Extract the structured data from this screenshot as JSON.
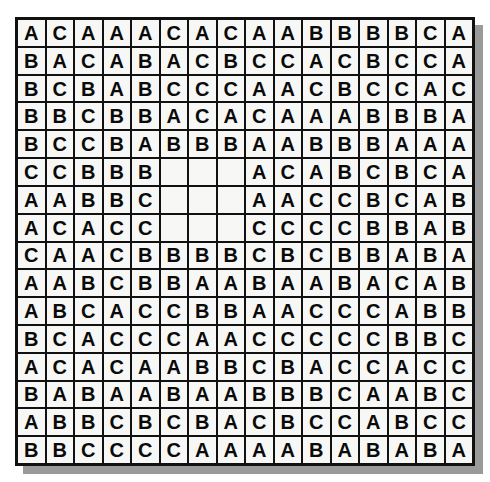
{
  "diagram": {
    "type": "character-grid",
    "rows": 16,
    "columns": 16,
    "alphabet": [
      "A",
      "B",
      "C"
    ],
    "empty_cell_symbol": "",
    "colors": {
      "background": "#ffffff",
      "cell_fill": "#f7f7f5",
      "grid_line": "#111111",
      "letter": "#0a0a0a",
      "shadow": "#9a9a9a"
    },
    "empty_region": {
      "row_start": 6,
      "row_end": 8,
      "column_start": 6,
      "column_end": 8
    },
    "grid": [
      [
        "A",
        "C",
        "A",
        "A",
        "A",
        "C",
        "A",
        "C",
        "A",
        "A",
        "B",
        "B",
        "B",
        "B",
        "C",
        "A"
      ],
      [
        "B",
        "A",
        "C",
        "A",
        "B",
        "A",
        "C",
        "B",
        "C",
        "C",
        "A",
        "C",
        "B",
        "C",
        "C",
        "A"
      ],
      [
        "B",
        "C",
        "B",
        "A",
        "B",
        "C",
        "C",
        "C",
        "A",
        "A",
        "C",
        "B",
        "C",
        "C",
        "A",
        "C"
      ],
      [
        "B",
        "B",
        "C",
        "B",
        "B",
        "A",
        "C",
        "A",
        "C",
        "A",
        "A",
        "A",
        "B",
        "B",
        "B",
        "A"
      ],
      [
        "B",
        "C",
        "C",
        "B",
        "A",
        "B",
        "B",
        "B",
        "A",
        "A",
        "B",
        "B",
        "B",
        "A",
        "A",
        "A"
      ],
      [
        "C",
        "C",
        "B",
        "B",
        "B",
        "",
        "",
        "",
        "A",
        "C",
        "A",
        "B",
        "C",
        "B",
        "C",
        "A"
      ],
      [
        "A",
        "A",
        "B",
        "B",
        "C",
        "",
        "",
        "",
        "A",
        "A",
        "C",
        "C",
        "B",
        "C",
        "A",
        "B"
      ],
      [
        "A",
        "C",
        "A",
        "C",
        "C",
        "",
        "",
        "",
        "C",
        "C",
        "C",
        "C",
        "B",
        "B",
        "A",
        "B"
      ],
      [
        "C",
        "A",
        "A",
        "C",
        "B",
        "B",
        "B",
        "B",
        "C",
        "B",
        "C",
        "B",
        "B",
        "A",
        "B",
        "A"
      ],
      [
        "A",
        "A",
        "B",
        "C",
        "B",
        "B",
        "A",
        "A",
        "B",
        "A",
        "A",
        "B",
        "A",
        "C",
        "A",
        "B"
      ],
      [
        "A",
        "B",
        "C",
        "A",
        "C",
        "C",
        "B",
        "B",
        "A",
        "A",
        "C",
        "C",
        "C",
        "A",
        "B",
        "B"
      ],
      [
        "B",
        "C",
        "A",
        "C",
        "C",
        "C",
        "A",
        "A",
        "C",
        "C",
        "C",
        "C",
        "C",
        "B",
        "B",
        "C"
      ],
      [
        "A",
        "C",
        "A",
        "C",
        "A",
        "A",
        "B",
        "B",
        "C",
        "B",
        "A",
        "C",
        "C",
        "A",
        "C",
        "C"
      ],
      [
        "B",
        "A",
        "B",
        "A",
        "A",
        "B",
        "A",
        "A",
        "B",
        "B",
        "B",
        "C",
        "A",
        "A",
        "B",
        "C"
      ],
      [
        "A",
        "B",
        "B",
        "C",
        "B",
        "C",
        "B",
        "A",
        "C",
        "B",
        "C",
        "C",
        "A",
        "B",
        "C",
        "C"
      ],
      [
        "B",
        "B",
        "C",
        "C",
        "C",
        "C",
        "A",
        "A",
        "A",
        "A",
        "B",
        "A",
        "B",
        "A",
        "B",
        "A"
      ]
    ]
  }
}
